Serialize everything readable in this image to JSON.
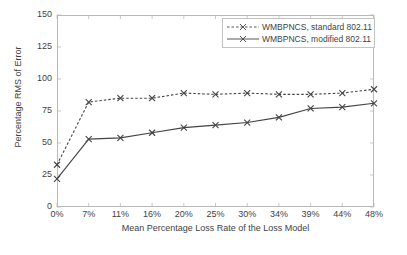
{
  "chart_data": {
    "type": "line",
    "title": "",
    "xlabel": "Mean Percentage Loss Rate of the Loss Model",
    "ylabel": "Percentage RMS of Error",
    "categories": [
      "0%",
      "7%",
      "11%",
      "16%",
      "20%",
      "25%",
      "30%",
      "34%",
      "39%",
      "44%",
      "48%"
    ],
    "x_tick_labels": [
      "0%",
      "7%",
      "11%",
      "16%",
      "20%",
      "25%",
      "30%",
      "34%",
      "39%",
      "44%",
      "48%"
    ],
    "y_tick_labels": [
      "0",
      "25",
      "50",
      "75",
      "100",
      "125",
      "150"
    ],
    "y_ticks": [
      0,
      25,
      50,
      75,
      100,
      125,
      150
    ],
    "ylim": [
      0,
      150
    ],
    "grid": false,
    "legend_position": "top-right",
    "series": [
      {
        "name": "WMBPNCS, standard 802.11",
        "style": "dashed",
        "marker": "x",
        "color": "#444444",
        "values": [
          33,
          82,
          85,
          85,
          89,
          88,
          89,
          88,
          88,
          89,
          92
        ]
      },
      {
        "name": "WMBPNCS, modified 802.11",
        "style": "solid",
        "marker": "x",
        "color": "#444444",
        "values": [
          22,
          53,
          54,
          58,
          62,
          64,
          66,
          70,
          77,
          78,
          81
        ]
      }
    ]
  },
  "legend": {
    "entries": [
      {
        "label": "WMBPNCS, standard 802.11"
      },
      {
        "label": "WMBPNCS, modified 802.11"
      }
    ]
  },
  "colors": {
    "axis": "#b9b9b9",
    "text": "#3f3f3f",
    "series": "#444444",
    "background": "#ffffff"
  }
}
